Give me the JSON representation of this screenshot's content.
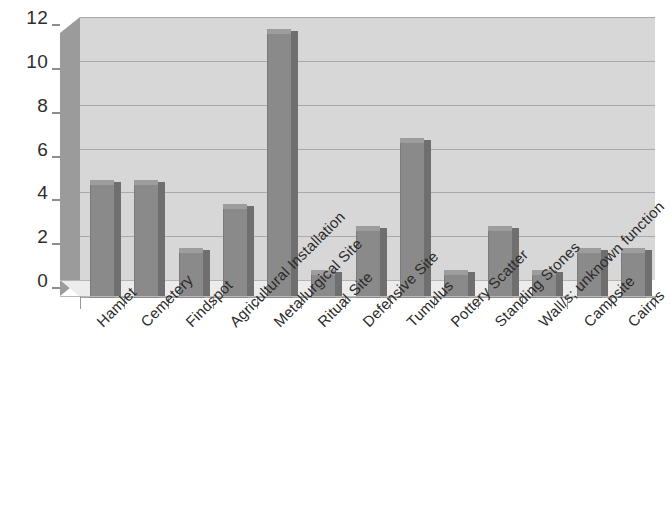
{
  "chart_data": {
    "type": "bar",
    "title": "",
    "subtitle": "",
    "xlabel": "",
    "ylabel": "",
    "categories": [
      "Hamlet",
      "Cemetery",
      "Findspot",
      "Agricultural Installation",
      "Metallurgical Site",
      "Ritual Site",
      "Defensive Site",
      "Tumulus",
      "Pottery Scatter",
      "Standing Stones",
      "Wall/s; unknown function",
      "Campsite",
      "Cairns"
    ],
    "values": [
      5.3,
      5.3,
      2.2,
      4.2,
      12.2,
      1.2,
      3.2,
      7.2,
      1.2,
      3.2,
      1.2,
      2.2,
      2.2
    ],
    "ylim": [
      0,
      12
    ],
    "ytick_labels": [
      "0",
      "2",
      "4",
      "6",
      "8",
      "10",
      "12"
    ],
    "ytick_values": [
      0,
      2,
      4,
      6,
      8,
      10,
      12
    ],
    "grid": true,
    "legend": false,
    "legend_position": "none",
    "style": "3d-column",
    "colors": {
      "bar_face": "#8a8a8a",
      "bar_top": "#9d9d9d",
      "bar_side": "#6f6f6f",
      "plot_background": "#d7d7d7",
      "gridline": "#a9a9a9",
      "axis_wall": "#9b9b9b",
      "floor": "#ececec",
      "text": "#2b2b2b",
      "page_background": "#ffffff"
    }
  }
}
